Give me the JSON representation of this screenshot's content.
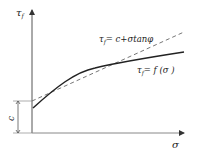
{
  "diagram": {
    "type": "mohr-coulomb-strength-envelope",
    "axes": {
      "y_label": "τ",
      "y_label_sub": "f",
      "x_label": "σ"
    },
    "intercept_label": "c",
    "curves": [
      {
        "name": "linear-envelope",
        "style": "dashed",
        "label": "τ",
        "label_sub": "f",
        "label_rest": "= c+σtanφ"
      },
      {
        "name": "nonlinear-envelope",
        "style": "solid",
        "label": "τ",
        "label_sub": "f",
        "label_rest": "= f (σ )"
      }
    ],
    "colors": {
      "line": "#333333",
      "axis": "#555555"
    }
  }
}
